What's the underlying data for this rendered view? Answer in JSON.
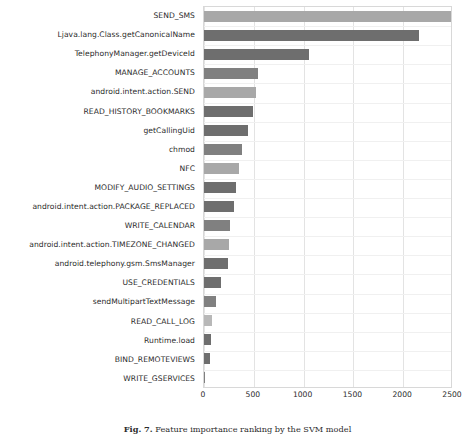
{
  "figure": {
    "caption_number": "Fig. 7.",
    "caption_text": "Feature importance ranking by the SVM model"
  },
  "chart_data": {
    "type": "bar",
    "orientation": "horizontal",
    "title": "",
    "xlabel": "",
    "ylabel": "",
    "xlim": [
      0,
      2500
    ],
    "xticks": [
      0,
      500,
      1000,
      1500,
      2000,
      2500
    ],
    "xtick_labels": [
      "0",
      "500",
      "1000",
      "1500",
      "2000",
      "2500"
    ],
    "grid": "vertical",
    "legend": "none",
    "categories": [
      "SEND_SMS",
      "Ljava.lang.Class.getCanonicalName",
      "TelephonyManager.getDeviceId",
      "MANAGE_ACCOUNTS",
      "android.intent.action.SEND",
      "READ_HISTORY_BOOKMARKS",
      "getCallingUid",
      "chmod",
      "NFC",
      "MODIFY_AUDIO_SETTINGS",
      "android.intent.action.PACKAGE_REPLACED",
      "WRITE_CALENDAR",
      "android.intent.action.TIMEZONE_CHANGED",
      "android.telephony.gsm.SmsManager",
      "USE_CREDENTIALS",
      "sendMultipartTextMessage",
      "READ_CALL_LOG",
      "Runtime.load",
      "BIND_REMOTEVIEWS",
      "WRITE_GSERVICES"
    ],
    "values": [
      2480,
      2160,
      1055,
      545,
      523,
      493,
      440,
      380,
      350,
      320,
      300,
      262,
      252,
      243,
      172,
      121,
      80,
      70,
      60,
      8
    ],
    "bar_colors": [
      "#a8a8a8",
      "#6e6e6e",
      "#6e6e6e",
      "#808080",
      "#a8a8a8",
      "#6e6e6e",
      "#6e6e6e",
      "#808080",
      "#a8a8a8",
      "#6e6e6e",
      "#6e6e6e",
      "#808080",
      "#a8a8a8",
      "#6e6e6e",
      "#6e6e6e",
      "#808080",
      "#b8b8b8",
      "#6e6e6e",
      "#6e6e6e",
      "#808080"
    ]
  },
  "colors": {
    "plot_border": "#d8d8d8",
    "gridline": "#e3e3e3",
    "text": "#2b2b2b",
    "background": "#ffffff"
  }
}
